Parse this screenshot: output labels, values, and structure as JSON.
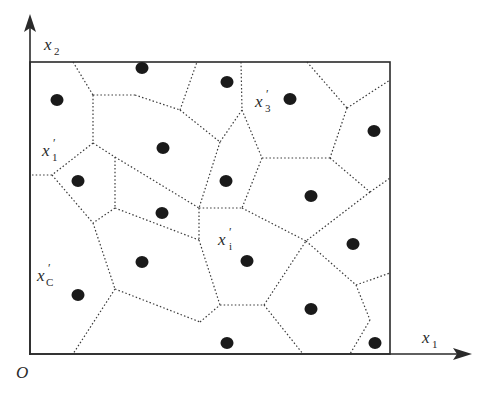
{
  "diagram": {
    "colors": {
      "axis": "#2a2a2a",
      "edge": "#3a3a3a",
      "site": "#1a1a1a",
      "background": "#ffffff"
    },
    "labels": {
      "origin": "O",
      "x_axis": {
        "base": "x",
        "sub": "1"
      },
      "y_axis": {
        "base": "x",
        "sub": "2"
      },
      "site_1": {
        "base": "x",
        "sub": "1",
        "prime": "′"
      },
      "site_3": {
        "base": "x",
        "sub": "3",
        "prime": "′"
      },
      "site_i": {
        "base": "x",
        "sub": "i",
        "prime": "′"
      },
      "site_C": {
        "base": "x",
        "sub": "C",
        "prime": "′"
      }
    },
    "frame": {
      "x0": 30,
      "y0": 62,
      "x1": 390,
      "y1": 354
    },
    "sites": [
      [
        142,
        68
      ],
      [
        57,
        100
      ],
      [
        163,
        148
      ],
      [
        227,
        82
      ],
      [
        290,
        99
      ],
      [
        374,
        131
      ],
      [
        78,
        181
      ],
      [
        162,
        213
      ],
      [
        226,
        181
      ],
      [
        311,
        196
      ],
      [
        353,
        244
      ],
      [
        142,
        262
      ],
      [
        247,
        261
      ],
      [
        78,
        295
      ],
      [
        311,
        309
      ],
      [
        227,
        343
      ],
      [
        375,
        343
      ]
    ],
    "edges": [
      [
        [
          73,
          62
        ],
        [
          93,
          95
        ]
      ],
      [
        [
          93,
          95
        ],
        [
          135,
          95
        ]
      ],
      [
        [
          135,
          95
        ],
        [
          180,
          110
        ]
      ],
      [
        [
          180,
          110
        ],
        [
          197,
          62
        ]
      ],
      [
        [
          93,
          95
        ],
        [
          93,
          143
        ]
      ],
      [
        [
          93,
          143
        ],
        [
          52,
          175
        ]
      ],
      [
        [
          52,
          175
        ],
        [
          30,
          175
        ]
      ],
      [
        [
          93,
          143
        ],
        [
          115,
          157
        ]
      ],
      [
        [
          115,
          157
        ],
        [
          199,
          208
        ]
      ],
      [
        [
          115,
          157
        ],
        [
          115,
          208
        ]
      ],
      [
        [
          115,
          208
        ],
        [
          93,
          223
        ]
      ],
      [
        [
          52,
          175
        ],
        [
          93,
          223
        ]
      ],
      [
        [
          115,
          208
        ],
        [
          199,
          240
        ]
      ],
      [
        [
          93,
          223
        ],
        [
          115,
          289
        ]
      ],
      [
        [
          115,
          289
        ],
        [
          73,
          354
        ]
      ],
      [
        [
          115,
          289
        ],
        [
          200,
          322
        ]
      ],
      [
        [
          200,
          322
        ],
        [
          220,
          305
        ]
      ],
      [
        [
          180,
          110
        ],
        [
          220,
          142
        ]
      ],
      [
        [
          241,
          62
        ],
        [
          242,
          110
        ]
      ],
      [
        [
          242,
          110
        ],
        [
          220,
          142
        ]
      ],
      [
        [
          220,
          142
        ],
        [
          199,
          208
        ]
      ],
      [
        [
          242,
          110
        ],
        [
          262,
          158
        ]
      ],
      [
        [
          262,
          158
        ],
        [
          330,
          158
        ]
      ],
      [
        [
          307,
          62
        ],
        [
          347,
          108
        ]
      ],
      [
        [
          347,
          108
        ],
        [
          390,
          80
        ]
      ],
      [
        [
          347,
          108
        ],
        [
          330,
          158
        ]
      ],
      [
        [
          330,
          158
        ],
        [
          370,
          192
        ]
      ],
      [
        [
          370,
          192
        ],
        [
          390,
          178
        ]
      ],
      [
        [
          262,
          158
        ],
        [
          242,
          208
        ]
      ],
      [
        [
          199,
          208
        ],
        [
          242,
          208
        ]
      ],
      [
        [
          242,
          208
        ],
        [
          306,
          241
        ]
      ],
      [
        [
          370,
          192
        ],
        [
          306,
          241
        ]
      ],
      [
        [
          199,
          208
        ],
        [
          199,
          240
        ]
      ],
      [
        [
          199,
          240
        ],
        [
          220,
          305
        ]
      ],
      [
        [
          220,
          305
        ],
        [
          264,
          305
        ]
      ],
      [
        [
          264,
          305
        ],
        [
          306,
          241
        ]
      ],
      [
        [
          264,
          305
        ],
        [
          303,
          354
        ]
      ],
      [
        [
          306,
          241
        ],
        [
          356,
          285
        ]
      ],
      [
        [
          356,
          285
        ],
        [
          390,
          273
        ]
      ],
      [
        [
          356,
          285
        ],
        [
          370,
          320
        ]
      ],
      [
        [
          370,
          320
        ],
        [
          350,
          354
        ]
      ]
    ]
  }
}
